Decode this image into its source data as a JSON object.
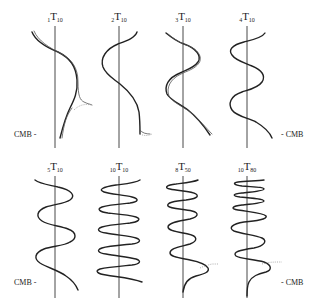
{
  "figure": {
    "panels": [
      {
        "id": "p1",
        "overtone": "1",
        "degree": "10",
        "letter": "T",
        "axis_x": 55,
        "label_x": 55,
        "row": 0
      },
      {
        "id": "p2",
        "overtone": "2",
        "degree": "10",
        "letter": "T",
        "axis_x": 119,
        "label_x": 119,
        "row": 0
      },
      {
        "id": "p3",
        "overtone": "3",
        "degree": "10",
        "letter": "T",
        "axis_x": 183,
        "label_x": 183,
        "row": 0
      },
      {
        "id": "p4",
        "overtone": "4",
        "degree": "10",
        "letter": "T",
        "axis_x": 247,
        "label_x": 247,
        "row": 0
      },
      {
        "id": "p5",
        "overtone": "5",
        "degree": "10",
        "letter": "T",
        "axis_x": 55,
        "label_x": 55,
        "row": 1
      },
      {
        "id": "p6",
        "overtone": "10",
        "degree": "10",
        "letter": "T",
        "axis_x": 119,
        "label_x": 119,
        "row": 1
      },
      {
        "id": "p7",
        "overtone": "8",
        "degree": "50",
        "letter": "T",
        "axis_x": 183,
        "label_x": 183,
        "row": 1
      },
      {
        "id": "p8",
        "overtone": "10",
        "degree": "80",
        "letter": "T",
        "axis_x": 247,
        "label_x": 247,
        "row": 1
      }
    ],
    "markers": {
      "top_left": "CMB -",
      "top_right": "- CMB",
      "bottom_left": "CMB -",
      "bottom_right": "- CMB"
    },
    "colors": {
      "ink": "#222222",
      "background": "#ffffff"
    }
  }
}
